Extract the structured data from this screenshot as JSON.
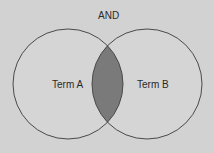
{
  "diagram": {
    "type": "venn",
    "operator": "AND",
    "sets": [
      {
        "label": "Term A"
      },
      {
        "label": "Term B"
      }
    ],
    "highlighted_region": "intersection"
  },
  "colors": {
    "background": "#d2d2d2",
    "circle_fill": "#d5d5d5",
    "circle_stroke": "#4a4a4a",
    "intersection_fill": "#7a7a7a"
  }
}
